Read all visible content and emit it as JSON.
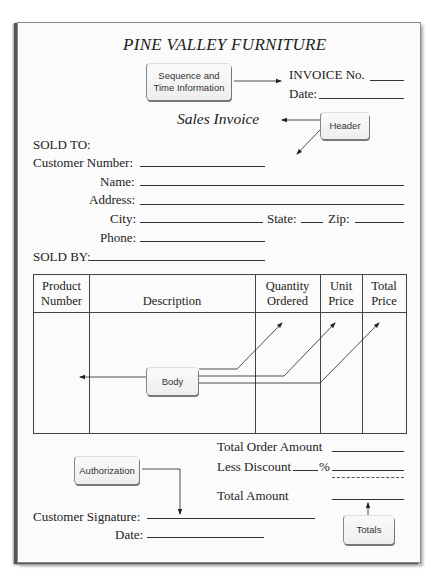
{
  "form": {
    "company": "PINE VALLEY FURNITURE",
    "invoice_no_label": "INVOICE No.",
    "date_label": "Date:",
    "form_title": "Sales Invoice",
    "sold_to_label": "SOLD TO:",
    "customer_number_label": "Customer Number:",
    "name_label": "Name:",
    "address_label": "Address:",
    "city_label": "City:",
    "state_label": "State:",
    "zip_label": "Zip:",
    "phone_label": "Phone:",
    "sold_by_label": "SOLD BY:"
  },
  "table": {
    "columns": [
      {
        "line1": "Product",
        "line2": "Number"
      },
      {
        "line1": "",
        "line2": "Description"
      },
      {
        "line1": "Quantity",
        "line2": "Ordered"
      },
      {
        "line1": "Unit",
        "line2": "Price"
      },
      {
        "line1": "Total",
        "line2": "Price"
      }
    ]
  },
  "totals": {
    "total_order_amount_label": "Total Order Amount",
    "less_discount_label": "Less Discount",
    "percent_sign": "%",
    "total_amount_label": "Total Amount"
  },
  "signature": {
    "customer_signature_label": "Customer Signature:",
    "date_label": "Date:"
  },
  "callouts": {
    "sequence_line1": "Sequence and",
    "sequence_line2": "Time Information",
    "header": "Header",
    "body": "Body",
    "authorization": "Authorization",
    "totals": "Totals"
  }
}
